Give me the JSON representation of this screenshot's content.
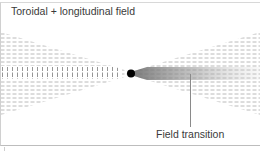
{
  "diagram": {
    "title": "Toroidal + longitudinal field",
    "annotations": [
      {
        "label": "Field transition",
        "points_to": "gradient region right of center"
      }
    ],
    "elements": {
      "center_dot": {
        "x": 131,
        "y": 73,
        "r": 4,
        "color": "#000000"
      },
      "left_wedge": {
        "description": "vector field arrows converging toward center; vertical ticks on axis, horizontal dashes off-axis",
        "color": "#9a9a9a"
      },
      "right_wedge": {
        "description": "vector field arrows diverging from center with shaded gradient band",
        "color": "#9a9a9a"
      },
      "leader_line": {
        "x": 190,
        "y1": 75,
        "y2": 127,
        "color": "#8a8a8a"
      }
    },
    "colors": {
      "text": "#3a3a3a",
      "arrows": "#9a9a9a",
      "border": "#cccccc",
      "dot": "#000000"
    }
  }
}
